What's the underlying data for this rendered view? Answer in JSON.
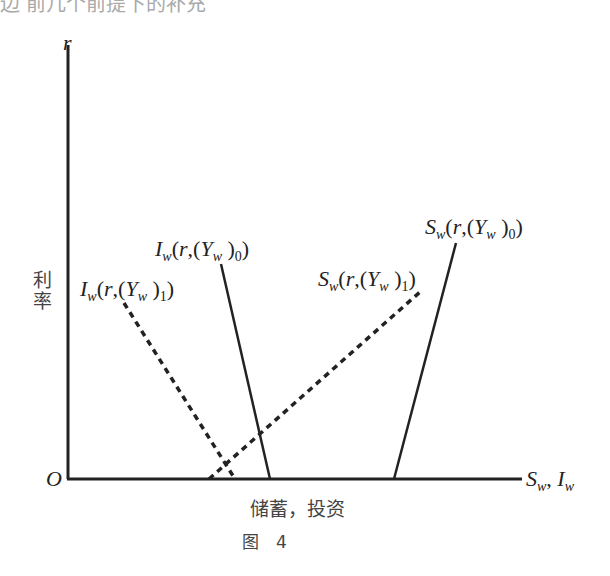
{
  "header_fragment": "边  前几个前提下的补充",
  "axes": {
    "y_label": "r",
    "y_cn_label": "利率",
    "origin": "O",
    "x_label": "S_w , I_w",
    "x_cn_label": "储蓄，投资"
  },
  "caption": "图　4",
  "curves": [
    {
      "name": "I_w(r,(Y_w)_1)",
      "style": "dashed",
      "label": "Iw(r,(Yw )1)"
    },
    {
      "name": "I_w(r,(Y_w)_0)",
      "style": "solid",
      "label": "Iw(r,(Yw )0)"
    },
    {
      "name": "S_w(r,(Y_w)_1)",
      "style": "dashed",
      "label": "Sw(r,(Yw )1)"
    },
    {
      "name": "S_w(r,(Y_w)_0)",
      "style": "solid",
      "label": "Sw(r,(Yw )0)"
    }
  ],
  "colors": {
    "ink": "#222222",
    "background": "#ffffff"
  }
}
